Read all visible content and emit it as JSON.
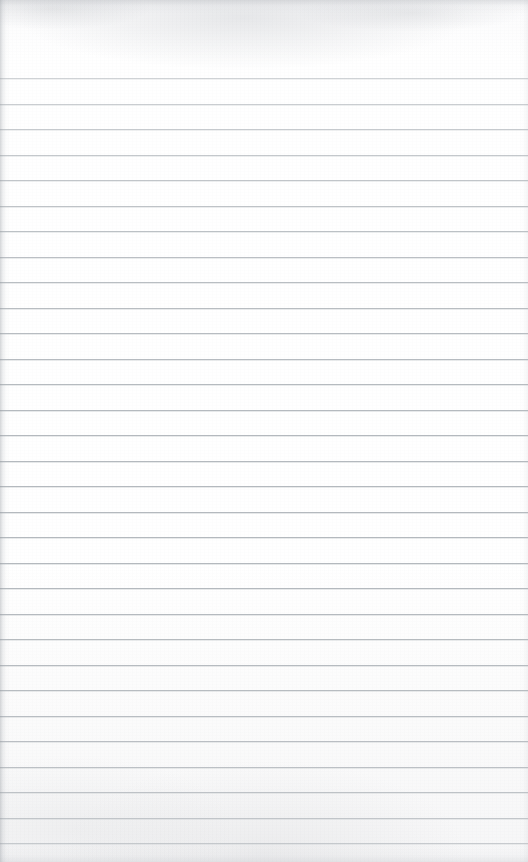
{
  "document": {
    "kind": "scanned-lined-paper",
    "title": "Blank ruled notebook page",
    "page_width": 528,
    "page_height": 862,
    "content_text": "",
    "has_handwriting": false,
    "has_printed_text": false,
    "orientation": "portrait"
  },
  "paper": {
    "background_color": "#fdfdfd",
    "background_color_bottom": "#f6f6f7",
    "texture": "scan-grain",
    "left_edge_shadow_color": "#969ba1",
    "top_smudge_color": "#a8acb2"
  },
  "ruling": {
    "line_color": "#b4b9be",
    "line_thickness_px": 1,
    "first_line_y": 78,
    "line_spacing_px": 25.5,
    "line_count": 31,
    "full_bleed": true,
    "margin_rule": false,
    "top_margin_px": 78,
    "line_y_positions": [
      78,
      103.5,
      129,
      154.5,
      180,
      205.5,
      231,
      256.5,
      282,
      307.5,
      333,
      358.5,
      384,
      409.5,
      435,
      460.5,
      486,
      511.5,
      537,
      562.5,
      588,
      613.5,
      639,
      664.5,
      690,
      715.5,
      741,
      766.5,
      792,
      817.5,
      843
    ],
    "line_opacities": [
      0.62,
      0.7,
      0.74,
      0.78,
      0.82,
      0.85,
      0.88,
      0.9,
      0.92,
      0.94,
      0.95,
      0.96,
      0.97,
      0.98,
      1.0,
      1.0,
      1.0,
      1.0,
      1.0,
      1.0,
      1.0,
      0.98,
      0.97,
      0.96,
      0.95,
      0.93,
      0.91,
      0.88,
      0.84,
      0.78,
      0.7
    ]
  }
}
